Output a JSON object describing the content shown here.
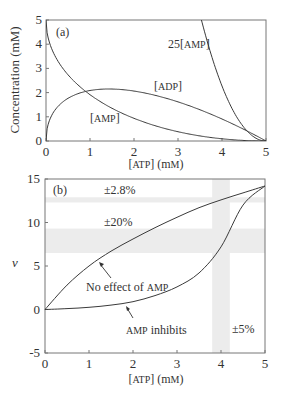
{
  "chart_data": [
    {
      "type": "line",
      "panel_label": "(a)",
      "title": "",
      "xlabel": "[ATP] (mM)",
      "ylabel": "Concentration (mM)",
      "xlim": [
        0,
        5
      ],
      "ylim": [
        0,
        5
      ],
      "xticks": [
        "0",
        "1",
        "2",
        "3",
        "4",
        "5"
      ],
      "yticks": [
        "0",
        "1",
        "2",
        "3",
        "4",
        "5"
      ],
      "grid": false,
      "x": [
        0,
        0.25,
        0.5,
        1.0,
        1.5,
        2.0,
        2.5,
        3.0,
        3.5,
        4.0,
        4.5,
        5.0
      ],
      "series": [
        {
          "name": "[ADP]",
          "values": [
            0,
            1.38,
            1.76,
            2.09,
            2.15,
            2.06,
            1.88,
            1.62,
            1.29,
            0.91,
            0.48,
            0
          ]
        },
        {
          "name": "[AMP]",
          "values": [
            5,
            3.37,
            2.74,
            1.91,
            1.35,
            0.94,
            0.62,
            0.38,
            0.21,
            0.09,
            0.02,
            0
          ]
        },
        {
          "name": "25[AMP]",
          "values": [
            null,
            null,
            null,
            null,
            null,
            null,
            null,
            null,
            5.0,
            2.27,
            0.58,
            0
          ]
        }
      ],
      "annotations": [
        "[ADP]",
        "[AMP]",
        "25[AMP]"
      ]
    },
    {
      "type": "line",
      "panel_label": "(b)",
      "xlabel": "[ATP] (mM)",
      "ylabel": "v",
      "xlim": [
        0,
        5
      ],
      "ylim": [
        -5,
        15
      ],
      "xticks": [
        "0",
        "1",
        "2",
        "3",
        "4",
        "5"
      ],
      "yticks": [
        "-5",
        "0",
        "5",
        "10",
        "15"
      ],
      "grid": false,
      "x": [
        0,
        0.5,
        1.0,
        1.5,
        2.0,
        2.5,
        3.0,
        3.5,
        4.0,
        4.5,
        5.0
      ],
      "series": [
        {
          "name": "No effect of AMP",
          "values": [
            0,
            2.8,
            5.0,
            6.7,
            8.1,
            9.4,
            10.6,
            11.7,
            12.6,
            13.4,
            14.2
          ]
        },
        {
          "name": "AMP inhibits",
          "values": [
            0,
            0.1,
            0.25,
            0.5,
            0.9,
            1.6,
            2.6,
            4.2,
            7.2,
            12.0,
            14.2
          ]
        }
      ],
      "shaded_bands": [
        {
          "orientation": "horizontal",
          "y_range": [
            12.3,
            12.9
          ],
          "label": "±2.8%"
        },
        {
          "orientation": "horizontal",
          "y_range": [
            6.5,
            9.3
          ],
          "label": "±20%"
        },
        {
          "orientation": "vertical",
          "x_range": [
            3.8,
            4.2
          ],
          "label": "±5%"
        }
      ],
      "annotations": [
        "No effect of AMP",
        "AMP inhibits",
        "±2.8%",
        "±20%",
        "±5%"
      ]
    }
  ],
  "panel_a": {
    "label": "(a)",
    "ylabel": "Concentration (mM)",
    "xlabel_main": "[ATP]",
    "xlabel_unit": "(mM)",
    "curve_labels": {
      "adp": "[ADP]",
      "amp": "[AMP]",
      "amp25": "25[AMP]"
    }
  },
  "panel_b": {
    "label": "(b)",
    "ylabel": "v",
    "xlabel_main": "[ATP]",
    "xlabel_unit": "(mM)",
    "band_labels": {
      "b1": "±2.8%",
      "b2": "±20%",
      "b3": "±5%"
    },
    "curve_labels": {
      "noeffect": "No effect of AMP",
      "inhibits": "AMP inhibits"
    }
  },
  "colors": {
    "line": "#3a3a3a",
    "axis": "#555555",
    "band": "#ececec"
  }
}
